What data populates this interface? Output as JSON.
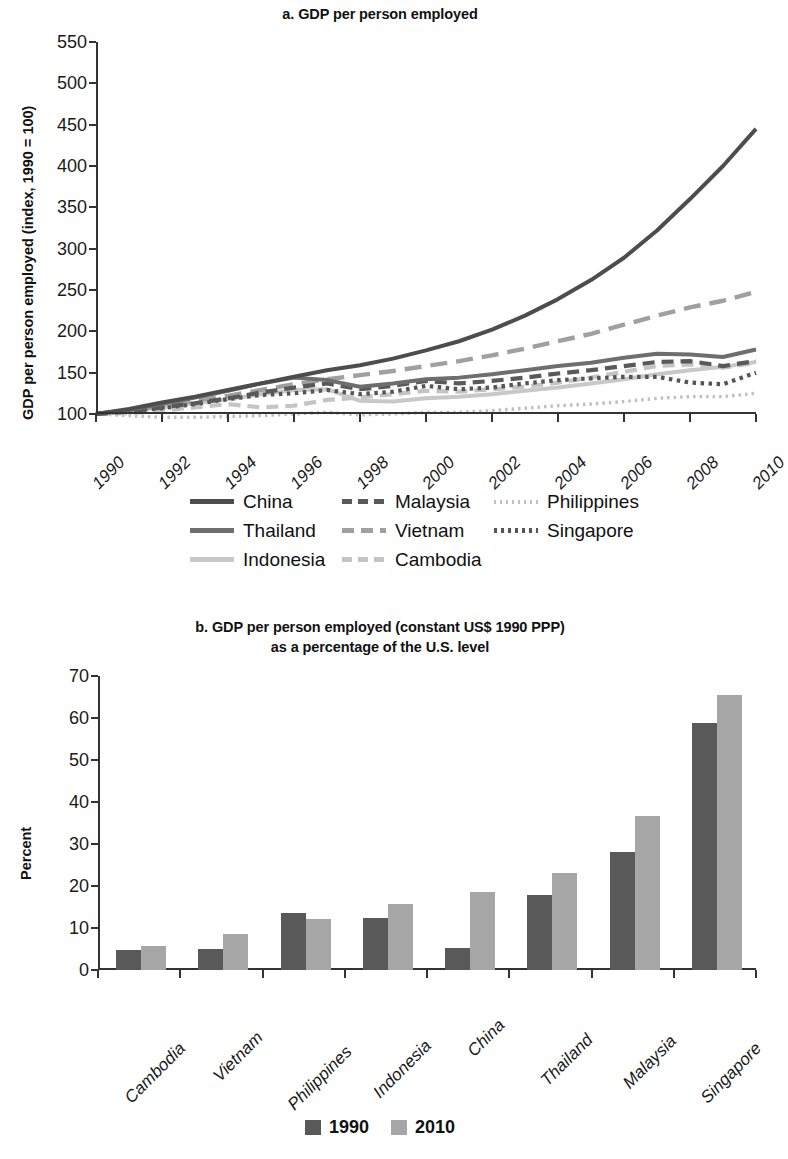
{
  "figure": {
    "panel_a": {
      "title": "a. GDP per person employed",
      "ylabel": "GDP per person employed (index, 1990 = 100)"
    },
    "panel_b": {
      "title_line1": "b. GDP per person employed (constant US$ 1990 PPP)",
      "title_line2": "as a percentage of the U.S. level",
      "ylabel": "Percent"
    }
  },
  "colors": {
    "china": "#4d4d4d",
    "thailand": "#6e6e6e",
    "indonesia": "#c8c8c8",
    "malaysia": "#595959",
    "vietnam": "#a0a0a0",
    "cambodia": "#c4c4c4",
    "philippines": "#c0c0c0",
    "singapore": "#555555",
    "bar_1990": "#595959",
    "bar_2010": "#a6a6a6",
    "axis": "#333333"
  },
  "chart_data": [
    {
      "type": "line",
      "title": "a. GDP per person employed",
      "xlabel": "",
      "ylabel": "GDP per person employed (index, 1990 = 100)",
      "ylim": [
        100,
        550
      ],
      "yticks": [
        100,
        150,
        200,
        250,
        300,
        350,
        400,
        450,
        500,
        550
      ],
      "xlim": [
        1990,
        2010
      ],
      "xticks": [
        1990,
        1992,
        1994,
        1996,
        1998,
        2000,
        2002,
        2004,
        2006,
        2008,
        2010
      ],
      "xtick_labels": [
        "1990",
        "1992",
        "1994",
        "1996",
        "1998",
        "2000",
        "2002",
        "2004",
        "2006",
        "2008",
        "2010"
      ],
      "grid": false,
      "legend_position": "below",
      "x": [
        1990,
        1991,
        1992,
        1993,
        1994,
        1995,
        1996,
        1997,
        1998,
        1999,
        2000,
        2001,
        2002,
        2003,
        2004,
        2005,
        2006,
        2007,
        2008,
        2009,
        2010
      ],
      "series": [
        {
          "name": "China",
          "style": "solid",
          "color": "#4d4d4d",
          "values": [
            100,
            106,
            114,
            121,
            129,
            137,
            145,
            153,
            159,
            167,
            177,
            188,
            202,
            219,
            239,
            262,
            289,
            322,
            360,
            400,
            445
          ]
        },
        {
          "name": "Thailand",
          "style": "solid",
          "color": "#6e6e6e",
          "values": [
            100,
            105,
            112,
            120,
            128,
            137,
            144,
            141,
            133,
            137,
            142,
            144,
            148,
            153,
            158,
            162,
            168,
            173,
            172,
            169,
            178
          ]
        },
        {
          "name": "Indonesia",
          "style": "solid",
          "color": "#c8c8c8",
          "values": [
            100,
            104,
            108,
            113,
            118,
            124,
            129,
            130,
            116,
            115,
            119,
            121,
            124,
            128,
            132,
            137,
            142,
            148,
            153,
            157,
            163
          ]
        },
        {
          "name": "Malaysia",
          "style": "dashed",
          "color": "#595959",
          "values": [
            100,
            103,
            108,
            113,
            119,
            126,
            132,
            137,
            130,
            134,
            140,
            137,
            140,
            144,
            149,
            153,
            158,
            163,
            164,
            158,
            164
          ]
        },
        {
          "name": "Vietnam",
          "style": "long-dash",
          "color": "#a0a0a0",
          "values": [
            100,
            104,
            110,
            116,
            122,
            129,
            136,
            142,
            147,
            152,
            158,
            164,
            171,
            179,
            188,
            197,
            208,
            219,
            229,
            237,
            248
          ]
        },
        {
          "name": "Cambodia",
          "style": "dashed",
          "color": "#c4c4c4",
          "values": [
            100,
            101,
            104,
            108,
            112,
            108,
            110,
            117,
            120,
            124,
            128,
            127,
            130,
            133,
            138,
            144,
            151,
            158,
            160,
            156,
            162
          ]
        },
        {
          "name": "Philippines",
          "style": "dotted-fine",
          "color": "#c0c0c0",
          "values": [
            100,
            98,
            96,
            96,
            97,
            98,
            100,
            102,
            99,
            100,
            102,
            102,
            104,
            107,
            110,
            112,
            115,
            119,
            121,
            121,
            125
          ]
        },
        {
          "name": "Singapore",
          "style": "dotted-bold",
          "color": "#555555",
          "values": [
            100,
            104,
            107,
            112,
            118,
            123,
            125,
            129,
            124,
            127,
            134,
            130,
            132,
            137,
            141,
            143,
            145,
            145,
            138,
            136,
            150
          ]
        }
      ]
    },
    {
      "type": "bar",
      "title": "b. GDP per person employed (constant US$ 1990 PPP) as a percentage of the U.S. level",
      "xlabel": "",
      "ylabel": "Percent",
      "ylim": [
        0,
        70
      ],
      "yticks": [
        0,
        10,
        20,
        30,
        40,
        50,
        60,
        70
      ],
      "grid": false,
      "legend_position": "below",
      "categories": [
        "Cambodia",
        "Vietnam",
        "Philippines",
        "Indonesia",
        "China",
        "Thailand",
        "Malaysia",
        "Singapore"
      ],
      "series": [
        {
          "name": "1990",
          "color": "#595959",
          "values": [
            4.8,
            4.9,
            13.6,
            12.4,
            5.3,
            17.8,
            28.1,
            58.8
          ]
        },
        {
          "name": "2010",
          "color": "#a6a6a6",
          "values": [
            5.8,
            8.6,
            12.2,
            15.6,
            18.6,
            23.2,
            36.6,
            65.4
          ]
        }
      ]
    }
  ],
  "legend_a": [
    {
      "label": "China",
      "key": "china"
    },
    {
      "label": "Malaysia",
      "key": "malaysia"
    },
    {
      "label": "Philippines",
      "key": "philippines"
    },
    {
      "label": "Thailand",
      "key": "thailand"
    },
    {
      "label": "Vietnam",
      "key": "vietnam"
    },
    {
      "label": "Singapore",
      "key": "singapore"
    },
    {
      "label": "Indonesia",
      "key": "indonesia"
    },
    {
      "label": "Cambodia",
      "key": "cambodia"
    }
  ],
  "legend_b": [
    {
      "label": "1990"
    },
    {
      "label": "2010"
    }
  ]
}
